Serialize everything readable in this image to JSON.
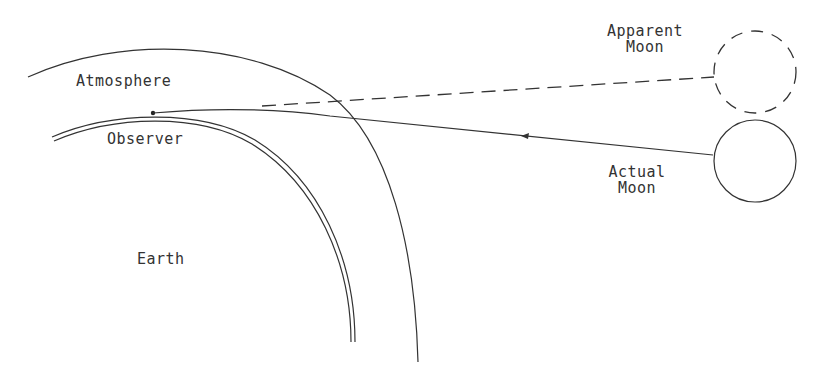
{
  "diagram": {
    "labels": {
      "atmosphere": "Atmosphere",
      "observer": "Observer",
      "earth": "Earth",
      "apparent_moon_line1": "Apparent",
      "apparent_moon_line2": "Moon",
      "actual_moon_line1": "Actual",
      "actual_moon_line2": "Moon"
    },
    "colors": {
      "stroke": "#333333",
      "background": "#ffffff"
    }
  }
}
